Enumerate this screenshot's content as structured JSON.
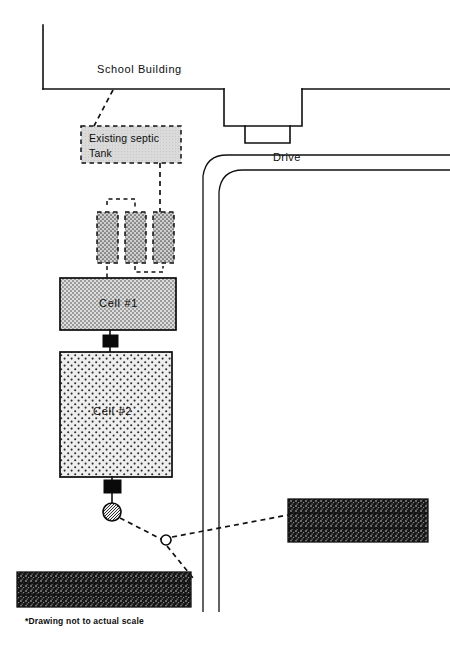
{
  "drawing": {
    "title": "School Septic System Site Plan",
    "note": "*Drawing not to actual scale"
  },
  "labels": {
    "school_building": "School  Building",
    "drive": "Drive",
    "existing_tank_line1": "Existing  septic",
    "existing_tank_line2": "Tank",
    "cell_1": "Cell  #1",
    "cell_2": "Cell  #2"
  },
  "colors": {
    "ink": "#101010",
    "paper": "#ffffff",
    "tank_fill": "#d8d8d8",
    "cell1_fill": "#d2d2d2",
    "cell2_fill": "#e3e3e3",
    "trench_fill": "#bdbdbd",
    "leachfield_fill": "#1a1a1a",
    "valve_fill": "#0a0a0a"
  },
  "features": [
    {
      "name": "school-building",
      "kind": "outline",
      "label": "School  Building"
    },
    {
      "name": "building-entry-portico",
      "kind": "outline",
      "label": ""
    },
    {
      "name": "drive",
      "kind": "outline",
      "label": "Drive"
    },
    {
      "name": "existing-septic-tank",
      "kind": "dashed-box",
      "label": "Existing  septic Tank"
    },
    {
      "name": "trench-1",
      "kind": "hatched-dashed-box",
      "label": ""
    },
    {
      "name": "trench-2",
      "kind": "hatched-dashed-box",
      "label": ""
    },
    {
      "name": "trench-3",
      "kind": "hatched-dashed-box",
      "label": ""
    },
    {
      "name": "cell-1",
      "kind": "stippled-box",
      "label": "Cell  #1"
    },
    {
      "name": "cell-2",
      "kind": "stippled-box",
      "label": "Cell  #2"
    },
    {
      "name": "valve-box-upper",
      "kind": "solid-black",
      "label": ""
    },
    {
      "name": "valve-box-lower",
      "kind": "solid-black",
      "label": ""
    },
    {
      "name": "distribution-box",
      "kind": "hatched-circle",
      "label": ""
    },
    {
      "name": "junction-node",
      "kind": "open-circle",
      "label": ""
    },
    {
      "name": "leach-field-east",
      "kind": "dark-hatched-box",
      "label": ""
    },
    {
      "name": "leach-field-south",
      "kind": "dark-hatched-box",
      "label": ""
    }
  ]
}
